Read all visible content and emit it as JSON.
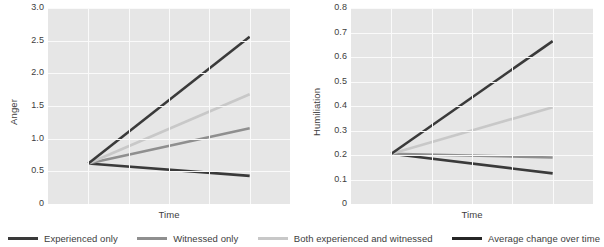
{
  "chart_data": [
    {
      "type": "line",
      "title": "",
      "xlabel": "Time",
      "ylabel": "Anger",
      "ylim": [
        0,
        3.0
      ],
      "yticks": [
        "0",
        "0.5",
        "1.0",
        "1.5",
        "2.0",
        "2.5",
        "3.0"
      ],
      "ytick_values": [
        0,
        0.5,
        1.0,
        1.5,
        2.0,
        2.5,
        3.0
      ],
      "x": [
        0,
        1
      ],
      "grid": true,
      "series": [
        {
          "name": "Experienced only",
          "values": [
            0.62,
            0.43
          ],
          "color": "#3a3a3a"
        },
        {
          "name": "Witnessed only",
          "values": [
            0.62,
            1.16
          ],
          "color": "#8f8f8f"
        },
        {
          "name": "Both experienced and witnessed",
          "values": [
            0.62,
            1.68
          ],
          "color": "#c8c8c8"
        },
        {
          "name": "Average change over time",
          "values": [
            0.62,
            2.56
          ],
          "color": "#3a3a3a"
        }
      ]
    },
    {
      "type": "line",
      "title": "",
      "xlabel": "Time",
      "ylabel": "Humiliation",
      "ylim": [
        0,
        0.8
      ],
      "yticks": [
        "0",
        "0.1",
        "0.2",
        "0.3",
        "0.4",
        "0.5",
        "0.6",
        "0.7",
        "0.8"
      ],
      "ytick_values": [
        0,
        0.1,
        0.2,
        0.3,
        0.4,
        0.5,
        0.6,
        0.7,
        0.8
      ],
      "x": [
        0,
        1
      ],
      "grid": true,
      "series": [
        {
          "name": "Experienced only",
          "values": [
            0.205,
            0.125
          ],
          "color": "#3a3a3a"
        },
        {
          "name": "Witnessed only",
          "values": [
            0.205,
            0.19
          ],
          "color": "#8f8f8f"
        },
        {
          "name": "Both experienced and witnessed",
          "values": [
            0.205,
            0.395
          ],
          "color": "#c8c8c8"
        },
        {
          "name": "Average change over time",
          "values": [
            0.205,
            0.665
          ],
          "color": "#3a3a3a"
        }
      ]
    }
  ],
  "legend": {
    "position": "bottom",
    "items": [
      {
        "label": "Experienced only",
        "color": "#3a3a3a"
      },
      {
        "label": "Witnessed only",
        "color": "#8f8f8f"
      },
      {
        "label": "Both experienced and witnessed",
        "color": "#c8c8c8"
      },
      {
        "label": "Average change over time",
        "color": "#262626"
      }
    ]
  },
  "style": {
    "plot_background": "#e6e6e6",
    "gridline_color": "#fafafa",
    "text_color": "#3d3d3d",
    "page_background": "#ffffff"
  }
}
